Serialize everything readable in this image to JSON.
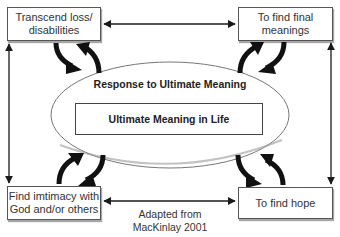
{
  "diagram": {
    "nodes": {
      "top_left": {
        "line1": "Transcend loss/",
        "line2": "disabilities"
      },
      "top_right": {
        "line1": "To find final",
        "line2": "meanings"
      },
      "bottom_left": {
        "line1": "Find imtimacy with",
        "line2": "God and/or others"
      },
      "bottom_right": {
        "line1": "To find hope"
      }
    },
    "ellipse_label": "Response to Ultimate Meaning",
    "center_label": "Ultimate Meaning in Life",
    "caption": {
      "line1": "Adapted from",
      "line2": "MacKinlay 2001"
    },
    "colors": {
      "line": "#1a1a1a",
      "border": "#555555",
      "background": "#ffffff"
    }
  }
}
